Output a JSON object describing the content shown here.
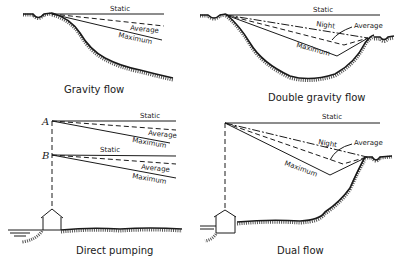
{
  "panels": [
    {
      "id": "gravity-flow",
      "caption": "Gravity flow",
      "lines": {
        "static": "Static",
        "average": "Average",
        "maximum": "Maximum"
      }
    },
    {
      "id": "double-gravity-flow",
      "caption": "Double gravity flow",
      "lines": {
        "static": "Static",
        "night": "Night",
        "average": "Average",
        "maximum": "Maximum"
      }
    },
    {
      "id": "direct-pumping",
      "caption": "Direct pumping",
      "points": {
        "a": "A",
        "b": "B"
      },
      "lines_a": {
        "static": "Static",
        "average": "Average",
        "maximum": "Maximum"
      },
      "lines_b": {
        "static": "Static",
        "average": "Average",
        "maximum": "Maximum"
      }
    },
    {
      "id": "dual-flow",
      "caption": "Dual flow",
      "lines": {
        "static": "Static",
        "night": "Night",
        "average": "Average",
        "maximum": "Maximum"
      }
    }
  ]
}
